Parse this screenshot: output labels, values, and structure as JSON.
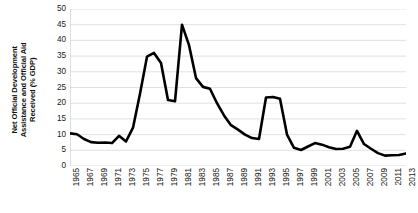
{
  "chart_data": {
    "type": "line",
    "title": "",
    "xlabel": "",
    "ylabel": "Net Official Development Assistance and Official Aid Received (% GDP)",
    "ylabel_lines": [
      "Net Official Development",
      "Assistance and Official Aid",
      "Received (% GDP)"
    ],
    "ylim": [
      0,
      50
    ],
    "ytick_step": 5,
    "yticks": [
      50,
      45,
      40,
      35,
      30,
      25,
      20,
      15,
      10,
      5,
      0
    ],
    "xlim": [
      1965,
      2013
    ],
    "xtick_step": 2,
    "xticks": [
      "1965",
      "1967",
      "1969",
      "1971",
      "1973",
      "1975",
      "1977",
      "1979",
      "1981",
      "1983",
      "1985",
      "1987",
      "1989",
      "1991",
      "1993",
      "1995",
      "1997",
      "1999",
      "2001",
      "2003",
      "2005",
      "2007",
      "2009",
      "2011",
      "2013"
    ],
    "grid": {
      "horizontal": true,
      "vertical": false,
      "color": "#d9d9d9"
    },
    "legend": {
      "visible": false,
      "position": "none"
    },
    "line_color": "#000000",
    "line_width": 2.6,
    "x": [
      1965,
      1966,
      1967,
      1968,
      1969,
      1970,
      1971,
      1972,
      1973,
      1974,
      1975,
      1976,
      1977,
      1978,
      1979,
      1980,
      1981,
      1982,
      1983,
      1984,
      1985,
      1986,
      1987,
      1988,
      1989,
      1990,
      1991,
      1992,
      1993,
      1994,
      1995,
      1996,
      1997,
      1998,
      1999,
      2000,
      2001,
      2002,
      2003,
      2004,
      2005,
      2006,
      2007,
      2008,
      2009,
      2010,
      2011,
      2012,
      2013
    ],
    "values": [
      10.4,
      10.1,
      8.6,
      7.6,
      7.4,
      7.5,
      7.3,
      9.6,
      7.8,
      12.2,
      23.0,
      34.8,
      36.0,
      32.8,
      21.0,
      20.6,
      45.0,
      38.5,
      28.0,
      25.2,
      24.6,
      20.0,
      16.1,
      13.0,
      11.6,
      10.0,
      8.9,
      8.6,
      21.8,
      22.0,
      21.4,
      10.0,
      5.8,
      5.1,
      6.2,
      7.3,
      6.8,
      6.0,
      5.4,
      5.5,
      6.1,
      11.2,
      7.0,
      5.5,
      4.1,
      3.3,
      3.4,
      3.5,
      4.0
    ],
    "series": [
      {
        "name": "Net ODA and Official Aid Received (% GDP)",
        "values": [
          10.4,
          10.1,
          8.6,
          7.6,
          7.4,
          7.5,
          7.3,
          9.6,
          7.8,
          12.2,
          23.0,
          34.8,
          36.0,
          32.8,
          21.0,
          20.6,
          45.0,
          38.5,
          28.0,
          25.2,
          24.6,
          20.0,
          16.1,
          13.0,
          11.6,
          10.0,
          8.9,
          8.6,
          21.8,
          22.0,
          21.4,
          10.0,
          5.8,
          5.1,
          6.2,
          7.3,
          6.8,
          6.0,
          5.4,
          5.5,
          6.1,
          11.2,
          7.0,
          5.5,
          4.1,
          3.3,
          3.4,
          3.5,
          4.0
        ]
      }
    ],
    "annotations": []
  }
}
